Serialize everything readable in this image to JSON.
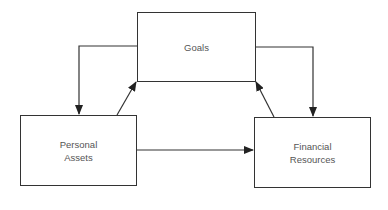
{
  "diagram": {
    "nodes": [
      {
        "id": "goals",
        "label": "Goals"
      },
      {
        "id": "personal_assets",
        "label": "Personal\nAssets"
      },
      {
        "id": "financial_resources",
        "label": "Financial\nResources"
      }
    ],
    "edges": [
      {
        "from": "goals",
        "to": "personal_assets"
      },
      {
        "from": "personal_assets",
        "to": "goals"
      },
      {
        "from": "goals",
        "to": "financial_resources"
      },
      {
        "from": "financial_resources",
        "to": "goals"
      },
      {
        "from": "personal_assets",
        "to": "financial_resources"
      }
    ],
    "colors": {
      "line": "#333333",
      "text": "#555555",
      "background": "#ffffff"
    }
  }
}
